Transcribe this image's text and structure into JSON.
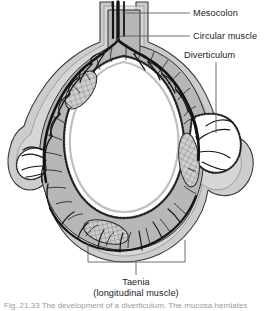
{
  "figure": {
    "type": "anatomical-illustration",
    "background_color": "#ffffff",
    "ink_color": "#1a1a1a",
    "tissue_fill": "#b9b9b9",
    "tissue_fill_light": "#d2d2d2",
    "lumen_color": "#ffffff",
    "leader_color": "#6b6b6b"
  },
  "labels": {
    "mesocolon": "Mesocolon",
    "circular_muscle": "Circular muscle",
    "diverticulum": "Diverticulum",
    "taenia_line1": "Taenia",
    "taenia_line2": "(longitudinal muscle)"
  },
  "caption": {
    "text": "Fig. 21.33 The development of a diverticulum. The mucosa herniates"
  }
}
